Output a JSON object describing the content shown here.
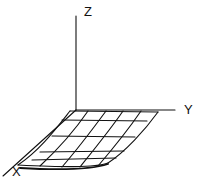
{
  "diagram": {
    "type": "3d-surface-wireframe",
    "axes": {
      "x_label": "X",
      "y_label": "Y",
      "z_label": "Z"
    },
    "surface": {
      "grid_columns": 6,
      "grid_rows": 5,
      "description": "nearly flat mesh in the X-Y plane with front edge curling downward"
    },
    "stroke_color": "#111111",
    "background": "#ffffff"
  }
}
